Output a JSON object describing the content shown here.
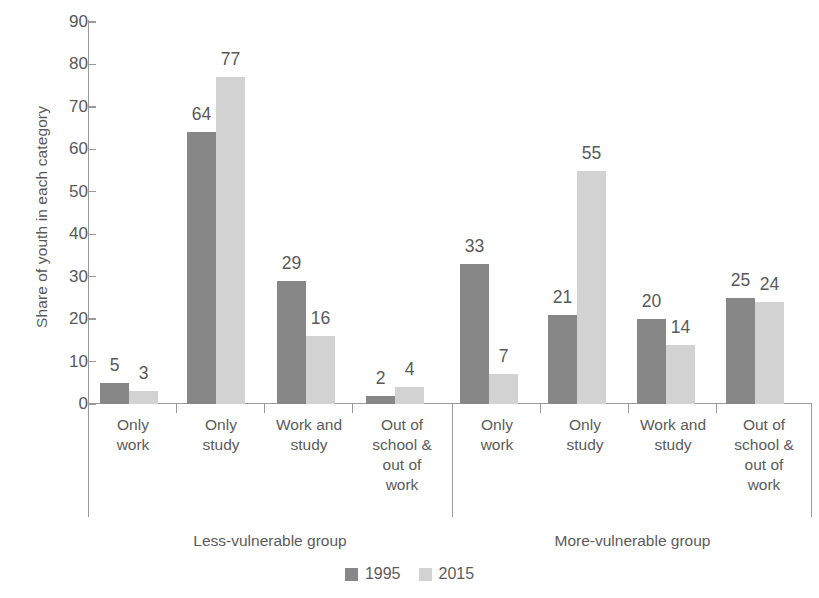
{
  "chart_data": {
    "type": "bar",
    "title": "",
    "subtitle": "",
    "xlabel": "",
    "ylabel": "Share of youth in each category",
    "ylim": [
      0,
      90
    ],
    "yticks": [
      0,
      10,
      20,
      30,
      40,
      50,
      60,
      70,
      80,
      90
    ],
    "grid": false,
    "legend_position": "bottom-center",
    "legend": [
      "1995",
      "2015"
    ],
    "series": [
      {
        "name": "1995",
        "color": "#878787",
        "values": [
          5,
          64,
          29,
          2,
          33,
          21,
          20,
          25
        ]
      },
      {
        "name": "2015",
        "color": "#d2d2d2",
        "values": [
          3,
          77,
          16,
          4,
          7,
          55,
          14,
          24
        ]
      }
    ],
    "categories": [
      "Only work",
      "Only study",
      "Work and study",
      "Out of school & out of work",
      "Only work",
      "Only study",
      "Work and study",
      "Out of school & out of work"
    ],
    "groups": [
      {
        "label": "Less-vulnerable group",
        "categories": [
          "Only work",
          "Only study",
          "Work and study",
          "Out of school & out of work"
        ]
      },
      {
        "label": "More-vulnerable group",
        "categories": [
          "Only work",
          "Only study",
          "Work and study",
          "Out of school & out of work"
        ]
      }
    ]
  },
  "axis": {
    "ylabel": "Share of youth in each category",
    "ytick_labels": [
      "90",
      "80",
      "70",
      "60",
      "50",
      "40",
      "30",
      "20",
      "10",
      "0"
    ]
  },
  "bars": [
    {
      "id": "g1-c1-1995",
      "series": "1995",
      "value": 5,
      "label": "5"
    },
    {
      "id": "g1-c1-2015",
      "series": "2015",
      "value": 3,
      "label": "3"
    },
    {
      "id": "g1-c2-1995",
      "series": "1995",
      "value": 64,
      "label": "64"
    },
    {
      "id": "g1-c2-2015",
      "series": "2015",
      "value": 77,
      "label": "77"
    },
    {
      "id": "g1-c3-1995",
      "series": "1995",
      "value": 29,
      "label": "29"
    },
    {
      "id": "g1-c3-2015",
      "series": "2015",
      "value": 16,
      "label": "16"
    },
    {
      "id": "g1-c4-1995",
      "series": "1995",
      "value": 2,
      "label": "2"
    },
    {
      "id": "g1-c4-2015",
      "series": "2015",
      "value": 4,
      "label": "4"
    },
    {
      "id": "g2-c1-1995",
      "series": "1995",
      "value": 33,
      "label": "33"
    },
    {
      "id": "g2-c1-2015",
      "series": "2015",
      "value": 7,
      "label": "7"
    },
    {
      "id": "g2-c2-1995",
      "series": "1995",
      "value": 21,
      "label": "21"
    },
    {
      "id": "g2-c2-2015",
      "series": "2015",
      "value": 55,
      "label": "55"
    },
    {
      "id": "g2-c3-1995",
      "series": "1995",
      "value": 20,
      "label": "20"
    },
    {
      "id": "g2-c3-2015",
      "series": "2015",
      "value": 14,
      "label": "14"
    },
    {
      "id": "g2-c4-1995",
      "series": "1995",
      "value": 25,
      "label": "25"
    },
    {
      "id": "g2-c4-2015",
      "series": "2015",
      "value": 24,
      "label": "24"
    }
  ],
  "category_labels": [
    {
      "line1": "Only",
      "line2": "work",
      "line3": "",
      "line4": ""
    },
    {
      "line1": "Only",
      "line2": "study",
      "line3": "",
      "line4": ""
    },
    {
      "line1": "Work and",
      "line2": "study",
      "line3": "",
      "line4": ""
    },
    {
      "line1": "Out of",
      "line2": "school &",
      "line3": "out of",
      "line4": "work"
    },
    {
      "line1": "Only",
      "line2": "work",
      "line3": "",
      "line4": ""
    },
    {
      "line1": "Only",
      "line2": "study",
      "line3": "",
      "line4": ""
    },
    {
      "line1": "Work and",
      "line2": "study",
      "line3": "",
      "line4": ""
    },
    {
      "line1": "Out of",
      "line2": "school &",
      "line3": "out of",
      "line4": "work"
    }
  ],
  "group_labels": {
    "left": "Less-vulnerable group",
    "right": "More-vulnerable group"
  },
  "legend": {
    "items": [
      {
        "label": "1995",
        "color": "#878787"
      },
      {
        "label": "2015",
        "color": "#d2d2d2"
      }
    ]
  },
  "colors": {
    "series_1995": "#878787",
    "series_2015": "#d2d2d2",
    "axis": "#9a9a9a",
    "text": "#5a5a5a",
    "background": "#ffffff"
  }
}
